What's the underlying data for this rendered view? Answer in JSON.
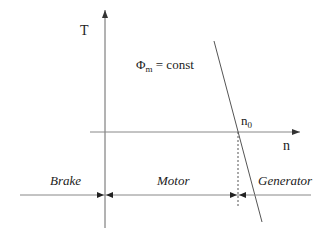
{
  "diagram": {
    "axes": {
      "y_label": "T",
      "x_label": "n"
    },
    "condition": {
      "symbol": "Φ",
      "subscript": "m",
      "rest": " = const"
    },
    "point": {
      "label": "n",
      "subscript": "0"
    },
    "regions": [
      {
        "label": "Brake"
      },
      {
        "label": "Motor"
      },
      {
        "label": "Generator"
      }
    ],
    "colors": {
      "line": "#555555",
      "text": "#222222"
    }
  }
}
